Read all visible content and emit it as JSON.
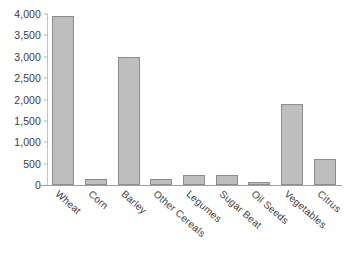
{
  "figure": {
    "title_remnant_left": "",
    "title_remnant_right": ""
  },
  "chart_data": {
    "type": "bar",
    "title": "",
    "xlabel": "",
    "ylabel": "",
    "categories": [
      "Wheat",
      "Corn",
      "Barley",
      "Other Cereals",
      "Legumes",
      "Sugar Beat",
      "Oil Seeds",
      "Vegetables",
      "Citrus"
    ],
    "values": [
      3950,
      150,
      3000,
      130,
      240,
      230,
      50,
      1900,
      600
    ],
    "ylim": [
      0,
      4000
    ],
    "ytick_values": [
      0,
      500,
      1000,
      1500,
      2000,
      2500,
      3000,
      3500,
      4000
    ],
    "ytick_labels": [
      "0",
      "500",
      "1,000",
      "1,500",
      "2,000",
      "2,500",
      "3,000",
      "3,500",
      "4,000"
    ],
    "grid": false,
    "legend": false,
    "legend_position": "none",
    "bar_color": "#bcbcbc",
    "bar_edge_color": "#8d8d8d",
    "axis_color": "#9e9e9e",
    "text_color": "#3d3d3d",
    "background": "#ffffff",
    "xtick_rotation": 41
  }
}
